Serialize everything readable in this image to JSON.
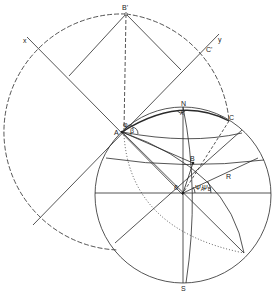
{
  "diagram": {
    "labels": {
      "B_prime": "B'",
      "x_axis": "x",
      "y_axis": "y",
      "C_prime": "C'",
      "N": "N",
      "lambda": "λ",
      "A": "A",
      "phi": "φ",
      "beta": "β",
      "C": "C",
      "B": "B",
      "R": "R",
      "delta": "δ",
      "psi_A": "Ψ",
      "psi_A_sub": "A",
      "psi_B": "Ψ",
      "psi_B_sub": "B",
      "S": "S"
    },
    "colors": {
      "ink": "#222222",
      "background": "#ffffff"
    }
  }
}
